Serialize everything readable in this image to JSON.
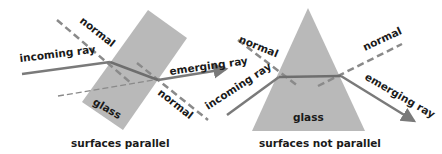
{
  "colors": {
    "background": "#ffffff",
    "glass": "#b9b9b9",
    "ray": "#7a7a7a",
    "normal": "#8a8a8a",
    "text": "#1a1a1a"
  },
  "left_diagram": {
    "caption": "surfaces parallel",
    "glass_label": "glass",
    "incoming_label": "incoming ray",
    "emerging_label": "emerging ray",
    "normal_top_label": "normal",
    "normal_bottom_label": "normal"
  },
  "right_diagram": {
    "caption": "surfaces not parallel",
    "glass_label": "glass",
    "incoming_label": "incoming ray",
    "emerging_label": "emerging ray",
    "normal_left_label": "normal",
    "normal_right_label": "normal"
  }
}
